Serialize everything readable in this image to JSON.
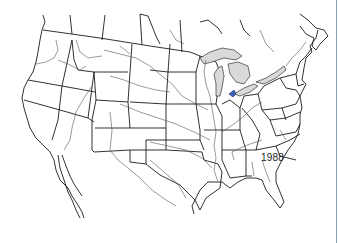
{
  "map": {
    "title": "North America state outline map",
    "year_label": "1988",
    "features": {
      "great_lakes": "shaded-gray",
      "highlight_region": "western Lake Erie (Toledo area)"
    },
    "colors": {
      "lines": "#1a1a1a",
      "rivers": "#555555",
      "lakes": "#d9d9d9",
      "highlight": "#3b5db8",
      "frame_edge": "#8e9fbf"
    }
  }
}
